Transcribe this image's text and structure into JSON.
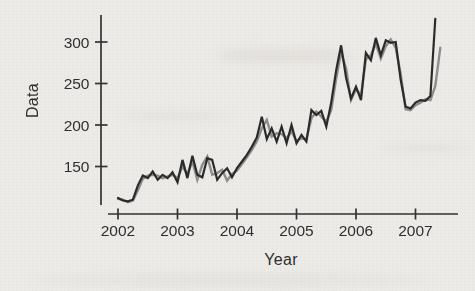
{
  "page": {
    "background_color": "#edebe8",
    "description_labels": {
      "xlabel": "Year",
      "ylabel": "Data"
    }
  },
  "chart_data": {
    "type": "line",
    "title": "",
    "xlabel": "Year",
    "ylabel": "Data",
    "x_ticks": [
      2002,
      2003,
      2004,
      2005,
      2006,
      2007
    ],
    "y_ticks": [
      150,
      200,
      250,
      300
    ],
    "xlim": [
      2001.9,
      2007.75
    ],
    "ylim": [
      100,
      330
    ],
    "grid": false,
    "legend": "none",
    "axis_color": "#333333",
    "tick_label_color": "#2f2f2f",
    "series": [
      {
        "name": "gray-line",
        "color": "#8d8d8d",
        "start_year": 2002.0,
        "interval": "monthly",
        "values": [
          111,
          110,
          107,
          109,
          121,
          135,
          139,
          140,
          139,
          136,
          138,
          140,
          136,
          150,
          141,
          156,
          134,
          152,
          162,
          140,
          142,
          146,
          133,
          141,
          145,
          153,
          161,
          170,
          180,
          196,
          206,
          186,
          190,
          189,
          184,
          192,
          181,
          184,
          183,
          208,
          216,
          210,
          204,
          218,
          256,
          288,
          268,
          230,
          243,
          236,
          279,
          284,
          298,
          280,
          295,
          303,
          293,
          262,
          219,
          218,
          224,
          227,
          231,
          230,
          247,
          293
        ]
      },
      {
        "name": "black-line",
        "color": "#2c2c2c",
        "start_year": 2002.0,
        "interval": "monthly",
        "values": [
          112,
          109,
          108,
          110,
          127,
          139,
          136,
          144,
          134,
          140,
          136,
          143,
          131,
          158,
          136,
          163,
          140,
          137,
          160,
          158,
          134,
          142,
          148,
          137,
          148,
          156,
          164,
          174,
          185,
          210,
          183,
          196,
          180,
          198,
          178,
          200,
          178,
          188,
          180,
          218,
          212,
          217,
          198,
          227,
          266,
          296,
          257,
          232,
          246,
          230,
          287,
          278,
          305,
          284,
          302,
          299,
          300,
          255,
          222,
          220,
          227,
          230,
          229,
          235,
          328
        ]
      }
    ]
  }
}
